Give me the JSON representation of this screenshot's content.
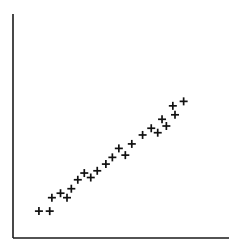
{
  "chart_data": {
    "type": "scatter",
    "title": "",
    "xlabel": "",
    "ylabel": "",
    "marker": "plus",
    "marker_color": "#111111",
    "axis_color": "#1a1a1a",
    "grid": false,
    "legend": null,
    "xlim": [
      0,
      100
    ],
    "ylim": [
      0,
      100
    ],
    "points": [
      {
        "x": 12,
        "y": 12
      },
      {
        "x": 17,
        "y": 12
      },
      {
        "x": 18,
        "y": 18
      },
      {
        "x": 22,
        "y": 20
      },
      {
        "x": 25,
        "y": 18
      },
      {
        "x": 27,
        "y": 22
      },
      {
        "x": 30,
        "y": 26
      },
      {
        "x": 33,
        "y": 29
      },
      {
        "x": 36,
        "y": 27
      },
      {
        "x": 39,
        "y": 30
      },
      {
        "x": 43,
        "y": 33
      },
      {
        "x": 46,
        "y": 36
      },
      {
        "x": 49,
        "y": 40
      },
      {
        "x": 52,
        "y": 37
      },
      {
        "x": 55,
        "y": 42
      },
      {
        "x": 60,
        "y": 46
      },
      {
        "x": 64,
        "y": 49
      },
      {
        "x": 67,
        "y": 47
      },
      {
        "x": 69,
        "y": 53
      },
      {
        "x": 71,
        "y": 50
      },
      {
        "x": 74,
        "y": 59
      },
      {
        "x": 75,
        "y": 55
      },
      {
        "x": 79,
        "y": 61
      }
    ]
  }
}
